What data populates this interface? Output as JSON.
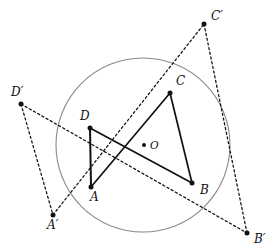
{
  "figure": {
    "background": "#ffffff",
    "stroke_solid": "#111111",
    "stroke_dashed": "#111111",
    "stroke_circle": "#8a8a8a",
    "dot_color": "#111111",
    "canvas": {
      "width": 280,
      "height": 252
    }
  },
  "circle": {
    "name": "circumscribed-circle",
    "cx": 143,
    "cy": 145,
    "r": 87,
    "stroke": "#8a8a8a",
    "stroke_width": 1.1
  },
  "points": [
    {
      "id": "A",
      "label": "A",
      "x": 91,
      "y": 187,
      "label_x": 90,
      "label_y": 201,
      "dot": true,
      "r": 2.5
    },
    {
      "id": "B",
      "label": "B",
      "x": 192,
      "y": 183,
      "label_x": 200,
      "label_y": 194,
      "dot": true,
      "r": 2.5
    },
    {
      "id": "C",
      "label": "C",
      "x": 170,
      "y": 93,
      "label_x": 176,
      "label_y": 85,
      "dot": true,
      "r": 2.5
    },
    {
      "id": "D",
      "label": "D",
      "x": 90,
      "y": 128,
      "label_x": 80,
      "label_y": 120,
      "dot": true,
      "r": 2.5
    },
    {
      "id": "O",
      "label": "O",
      "x": 144,
      "y": 145,
      "label_x": 150,
      "label_y": 149,
      "dot": true,
      "r": 2.0
    },
    {
      "id": "Ap",
      "label": "A′",
      "x": 53,
      "y": 215,
      "label_x": 47,
      "label_y": 229,
      "dot": true,
      "r": 2.5
    },
    {
      "id": "Bp",
      "label": "B′",
      "x": 247,
      "y": 233,
      "label_x": 254,
      "label_y": 243,
      "dot": true,
      "r": 2.5
    },
    {
      "id": "Cp",
      "label": "C′",
      "x": 204,
      "y": 24,
      "label_x": 211,
      "label_y": 20,
      "dot": true,
      "r": 2.5
    },
    {
      "id": "Dp",
      "label": "D′",
      "x": 21,
      "y": 104,
      "label_x": 11,
      "label_y": 96,
      "dot": true,
      "r": 2.5
    }
  ],
  "solid_edges": [
    {
      "name": "edge-A-D",
      "from": "A",
      "to": "D",
      "width": 2.0
    },
    {
      "name": "edge-D-B",
      "from": "D",
      "to": "B",
      "width": 1.7
    },
    {
      "name": "edge-A-C",
      "from": "A",
      "to": "C",
      "width": 1.7
    },
    {
      "name": "edge-C-B",
      "from": "C",
      "to": "B",
      "width": 1.7
    }
  ],
  "dashed_edges": [
    {
      "name": "edge-Dp-Ap",
      "from": "Dp",
      "to": "Ap",
      "width": 1.25
    },
    {
      "name": "edge-Ap-Cp",
      "from": "Ap",
      "to": "Cp",
      "width": 1.25
    },
    {
      "name": "edge-Cp-Bp",
      "from": "Cp",
      "to": "Bp",
      "width": 1.25
    },
    {
      "name": "edge-Dp-Bp",
      "from": "Dp",
      "to": "Bp",
      "width": 1.25
    }
  ],
  "chart_data": {
    "type": "scatter",
    "title": "",
    "xlabel": "",
    "ylabel": "",
    "grid": false,
    "legend": "none",
    "annotations": [
      "A",
      "B",
      "C",
      "D",
      "O",
      "A′",
      "B′",
      "C′",
      "D′"
    ],
    "vertices": {
      "A": [
        91,
        187
      ],
      "B": [
        192,
        183
      ],
      "C": [
        170,
        93
      ],
      "D": [
        90,
        128
      ],
      "O": [
        144,
        145
      ],
      "A'": [
        53,
        215
      ],
      "B'": [
        247,
        233
      ],
      "C'": [
        204,
        24
      ],
      "D'": [
        21,
        104
      ]
    },
    "circle": {
      "center": [
        143,
        145
      ],
      "radius": 87
    },
    "solid_segments": [
      [
        "A",
        "D"
      ],
      [
        "D",
        "B"
      ],
      [
        "A",
        "C"
      ],
      [
        "C",
        "B"
      ]
    ],
    "dashed_segments": [
      [
        "D'",
        "A'"
      ],
      [
        "A'",
        "C'"
      ],
      [
        "C'",
        "B'"
      ],
      [
        "D'",
        "B'"
      ]
    ]
  }
}
